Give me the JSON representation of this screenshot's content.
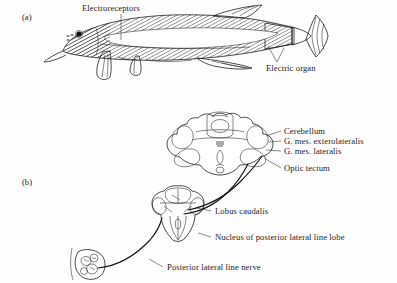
{
  "figure": {
    "background_color": "#fefefe",
    "ink_color": "#1d1d1d",
    "text_color": "#232323"
  },
  "panels": [
    {
      "tag": "(a)",
      "tag_x": 22,
      "tag_y": 12,
      "description": "Lateral view of a mormyrid electric fish with hatched body showing electroreceptor distribution and the electric organ in the caudal peduncle"
    },
    {
      "tag": "(b)",
      "tag_x": 22,
      "tag_y": 177,
      "description": "Dorsal view of the electric fish brain with the posterior lateral line lobe, lobus caudalis and a skin cross-section containing electroreceptors"
    }
  ],
  "labels": [
    {
      "id": "electroreceptors",
      "text": "Electroreceptors",
      "x": 82,
      "y": 3,
      "panel": "(a)",
      "leader": "vertical line down from label to the hatched head region"
    },
    {
      "id": "electric-organ",
      "text": "Electric organ",
      "x": 266,
      "y": 63,
      "panel": "(a)",
      "leader": "diagonal line up-left to the dark hatched caudal peduncle"
    },
    {
      "id": "cerebellum",
      "text": "Cerebellum",
      "x": 284,
      "y": 128,
      "panel": "(b)",
      "leader": "short line left to the large dorsal cerebellar lobe"
    },
    {
      "id": "g-mes-exterolateralis",
      "text": "G. mes. exterolateralis",
      "x": 284,
      "y": 138,
      "panel": "(b)",
      "leader": "short line left to the lateral bulge of the midbrain"
    },
    {
      "id": "g-mes-lateralis",
      "text": "G. mes. lateralis",
      "x": 284,
      "y": 148,
      "panel": "(b)",
      "leader": "short line left to the medial midbrain region"
    },
    {
      "id": "optic-tectum",
      "text": "Optic tectum",
      "x": 284,
      "y": 165,
      "panel": "(b)",
      "leader": "diagonal line up-left to the optic tectum"
    },
    {
      "id": "lobus-caudalis",
      "text": "Lobus caudalis",
      "x": 215,
      "y": 208,
      "panel": "(b)",
      "leader": "short line left to the upper part of the lower brain section"
    },
    {
      "id": "nucleus-posterior-lateral-line-lobe",
      "text": "Nucleus of posterior lateral line lobe",
      "x": 215,
      "y": 234,
      "panel": "(b)",
      "leader": "short line left to the lateral body of the lower brain section"
    },
    {
      "id": "posterior-lateral-line-nerve",
      "text": "Posterior lateral line nerve",
      "x": 167,
      "y": 264,
      "panel": "(b)",
      "leader": "short line up-left to the curving nerve trunk"
    }
  ],
  "anatomy": {
    "fish": {
      "parts": [
        "head",
        "eye",
        "body",
        "pectoral-fin",
        "pelvic-fin",
        "anal-fin",
        "dorsal-fin",
        "caudal-peduncle",
        "caudal-fin",
        "electric-organ",
        "lateral-stripe"
      ],
      "hatching": "fine diagonal line shading over body and fins"
    },
    "brain_upper": {
      "parts": [
        "cerebellum",
        "valvula",
        "g-mes-exterolateralis",
        "g-mes-lateralis",
        "optic-tectum",
        "midline-groove"
      ]
    },
    "brain_lower": {
      "parts": [
        "lobus-caudalis",
        "nucleus-of-posterior-lateral-line-lobe",
        "medulla",
        "midline"
      ]
    },
    "skin_section": {
      "parts": [
        "epidermis",
        "electroreceptor-organ",
        "receptor-cells",
        "nerve-fiber"
      ]
    },
    "connections": [
      "posterior lateral line nerve runs from skin section to the posterior lateral line lobe",
      "ascending pathway runs from the lower brain section to the upper brain"
    ]
  }
}
